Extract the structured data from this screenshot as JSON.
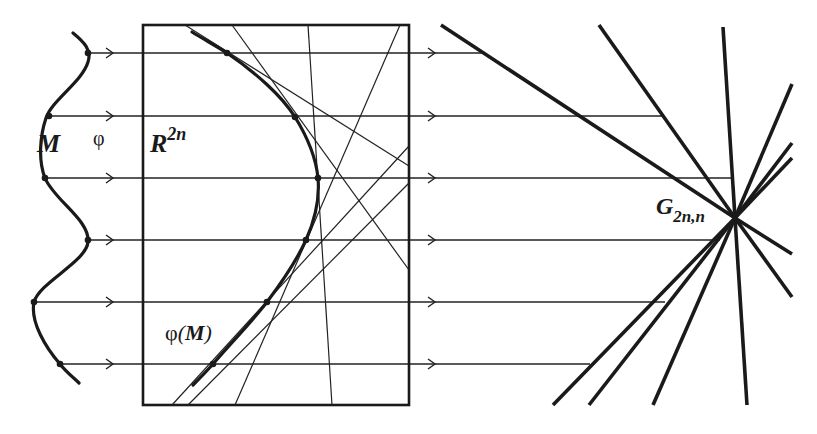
{
  "labels": {
    "manifold": "M",
    "map": "φ",
    "space": "R",
    "space_exp": "2n",
    "image": "φ(M)",
    "image_prefix": "φ",
    "image_inner": "M",
    "grassmann": "G",
    "grassmann_sub": "2n,n"
  },
  "colors": {
    "ink": "#1a1a1a",
    "background": "#ffffff"
  },
  "geometry": {
    "box": {
      "x": 143,
      "y": 25,
      "width": 266,
      "height": 380
    },
    "rays_y": [
      53,
      116,
      178,
      240,
      302,
      364
    ],
    "source_points": [
      [
        88,
        53
      ],
      [
        49,
        116
      ],
      [
        45,
        178
      ],
      [
        88,
        240
      ],
      [
        34,
        302
      ],
      [
        60,
        364
      ]
    ],
    "image_points": [
      [
        227,
        53
      ],
      [
        295,
        117
      ],
      [
        318,
        178
      ],
      [
        306,
        240
      ],
      [
        267,
        302
      ],
      [
        213,
        364
      ]
    ],
    "ray_ends_right": [
      485,
      663,
      731,
      720,
      665,
      590
    ],
    "grassmann_center": [
      735,
      218
    ],
    "pencil_ends": [
      [
        441,
        25
      ],
      [
        599,
        25
      ],
      [
        723,
        27
      ],
      [
        792,
        84
      ],
      [
        792,
        143
      ],
      [
        792,
        158
      ],
      [
        792,
        254
      ],
      [
        792,
        297
      ],
      [
        747,
        405
      ],
      [
        653,
        405
      ],
      [
        589,
        405
      ],
      [
        553,
        405
      ]
    ]
  }
}
